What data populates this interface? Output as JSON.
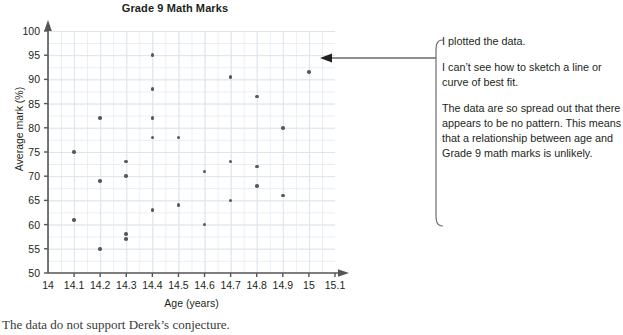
{
  "chart": {
    "title": "Grade 9 Math Marks",
    "x_axis_title": "Age (years)",
    "y_axis_title": "Average mark (%)"
  },
  "chart_data": {
    "type": "scatter",
    "title": "Grade 9 Math Marks",
    "xlabel": "Age (years)",
    "ylabel": "Average mark (%)",
    "xlim": [
      14,
      15.1
    ],
    "ylim": [
      50,
      100
    ],
    "grid": true,
    "legend": "none",
    "xticks": [
      "14",
      "14.1",
      "14.2",
      "14.3",
      "14.4",
      "14.5",
      "14.6",
      "14.7",
      "14.8",
      "14.9",
      "15",
      "15.1"
    ],
    "yticks": [
      "50",
      "55",
      "60",
      "65",
      "70",
      "75",
      "80",
      "85",
      "90",
      "95",
      "100"
    ],
    "x": [
      14.1,
      14.1,
      14.2,
      14.2,
      14.2,
      14.3,
      14.3,
      14.3,
      14.3,
      14.4,
      14.4,
      14.4,
      14.4,
      14.4,
      14.5,
      14.5,
      14.6,
      14.6,
      14.7,
      14.7,
      14.7,
      14.8,
      14.8,
      14.8,
      14.9,
      14.9,
      15.0
    ],
    "y": [
      75,
      61,
      82,
      69,
      55,
      73,
      70,
      58,
      57,
      95,
      88,
      82,
      78,
      63,
      78,
      64,
      71,
      60,
      90.5,
      73,
      65,
      86.5,
      72,
      68,
      80,
      66,
      91.5
    ],
    "points": [
      {
        "x": 14.1,
        "y": 75
      },
      {
        "x": 14.1,
        "y": 61
      },
      {
        "x": 14.2,
        "y": 82
      },
      {
        "x": 14.2,
        "y": 69
      },
      {
        "x": 14.2,
        "y": 55
      },
      {
        "x": 14.3,
        "y": 73
      },
      {
        "x": 14.3,
        "y": 70
      },
      {
        "x": 14.3,
        "y": 58
      },
      {
        "x": 14.3,
        "y": 57
      },
      {
        "x": 14.4,
        "y": 95
      },
      {
        "x": 14.4,
        "y": 88
      },
      {
        "x": 14.4,
        "y": 82
      },
      {
        "x": 14.4,
        "y": 78
      },
      {
        "x": 14.4,
        "y": 63
      },
      {
        "x": 14.5,
        "y": 78
      },
      {
        "x": 14.5,
        "y": 64
      },
      {
        "x": 14.6,
        "y": 71
      },
      {
        "x": 14.6,
        "y": 60
      },
      {
        "x": 14.7,
        "y": 90.5
      },
      {
        "x": 14.7,
        "y": 73
      },
      {
        "x": 14.7,
        "y": 65
      },
      {
        "x": 14.8,
        "y": 86.5
      },
      {
        "x": 14.8,
        "y": 72
      },
      {
        "x": 14.8,
        "y": 68
      },
      {
        "x": 14.9,
        "y": 80
      },
      {
        "x": 14.9,
        "y": 66
      },
      {
        "x": 15.0,
        "y": 91.5
      }
    ],
    "marker_color": "#585858",
    "grid_color": "#e9eef3",
    "axis_color": "#555555"
  },
  "callout": {
    "paragraphs": [
      "I plotted the data.",
      "I can’t see how to sketch a line or curve of best fit.",
      "The data are so spread out that there appears to be no pattern. This means that a relationship between age and Grade 9 math marks is unlikely."
    ]
  },
  "caption": {
    "text": "The data do not support Derek’s conjecture."
  }
}
